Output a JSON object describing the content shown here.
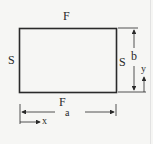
{
  "diagram": {
    "type": "rectangular plate with edge boundary conditions",
    "labels": {
      "top_edge": "F",
      "bottom_edge": "F",
      "bottom_edge_subscript": "a",
      "left_edge": "S",
      "right_edge": "S",
      "width_dimension": "a",
      "height_dimension": "b",
      "x_axis": "x",
      "y_axis": "y"
    },
    "colors": {
      "background": "#f6f6f4",
      "stroke": "#2a2a2a"
    }
  }
}
